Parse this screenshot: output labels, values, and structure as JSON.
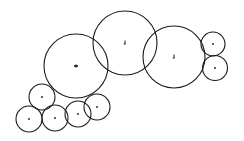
{
  "diagram": {
    "type": "circle-packing",
    "stroke_color": "#1a1a1a",
    "background": "#ffffff",
    "circles": [
      {
        "id": "large-left",
        "cx": 76,
        "cy": 66,
        "r": 32,
        "marker": "cross"
      },
      {
        "id": "large-middle",
        "cx": 125,
        "cy": 43,
        "r": 32,
        "marker": "tick"
      },
      {
        "id": "large-right",
        "cx": 174,
        "cy": 57,
        "r": 31,
        "marker": "tick"
      },
      {
        "id": "small-right-top",
        "cx": 213,
        "cy": 44,
        "r": 12,
        "marker": "dot"
      },
      {
        "id": "small-right-bottom",
        "cx": 215,
        "cy": 68,
        "r": 12.5,
        "marker": "dot"
      },
      {
        "id": "small-left-top",
        "cx": 42,
        "cy": 97,
        "r": 13,
        "marker": "dot"
      },
      {
        "id": "small-left-bottom",
        "cx": 29,
        "cy": 119,
        "r": 13,
        "marker": "dot"
      },
      {
        "id": "small-bottom-2",
        "cx": 55,
        "cy": 118,
        "r": 13,
        "marker": "dot"
      },
      {
        "id": "small-bottom-3",
        "cx": 78,
        "cy": 114,
        "r": 13,
        "marker": "dot"
      },
      {
        "id": "small-bottom-4",
        "cx": 97,
        "cy": 107,
        "r": 13,
        "marker": "dot"
      }
    ]
  }
}
